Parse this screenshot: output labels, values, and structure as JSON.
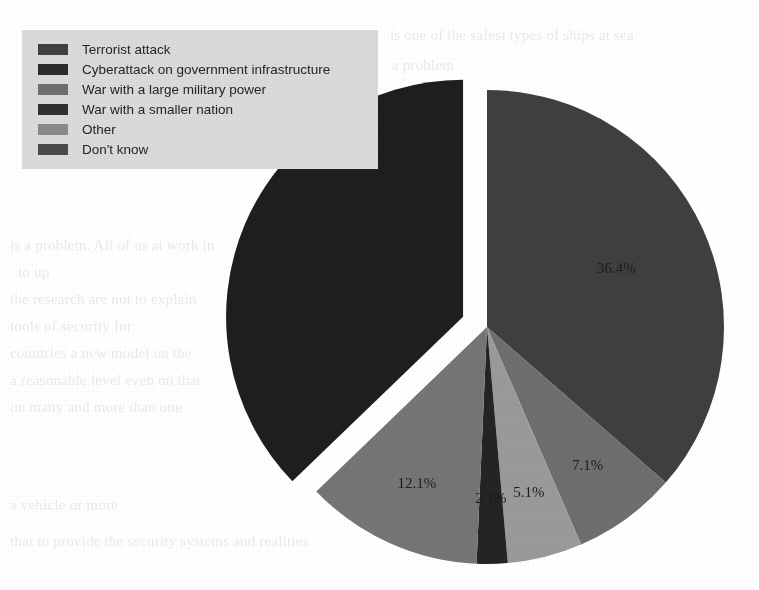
{
  "legend": {
    "items": [
      {
        "label": "Terrorist attack",
        "color": "#3f3f3f"
      },
      {
        "label": "Cyberattack on government infrastructure",
        "color": "#2b2b2b"
      },
      {
        "label": "War with a large military power",
        "color": "#6e6e6e"
      },
      {
        "label": "War with a smaller nation",
        "color": "#303030"
      },
      {
        "label": "Other",
        "color": "#8a8a8a"
      },
      {
        "label": "Don't know",
        "color": "#4a4a4a"
      }
    ]
  },
  "chart_data": {
    "type": "pie",
    "title": "",
    "labels": [
      "Terrorist attack",
      "Cyberattack on government infrastructure",
      "War with a large military power",
      "War with a smaller nation",
      "Other",
      "Don't know"
    ],
    "values": [
      36.4,
      7.1,
      5.1,
      2.1,
      12.1,
      37.2
    ],
    "value_labels": [
      "36.4%",
      "7.1%",
      "5.1%",
      "2.1%",
      "12.1%",
      ""
    ],
    "colors": [
      "#3f3f3f",
      "#6e6e6e",
      "#9a9a9a",
      "#242424",
      "#757575",
      "#1e1e1e"
    ],
    "exploded": [
      false,
      false,
      false,
      false,
      false,
      true
    ],
    "legend_position": "top-left",
    "grid": false,
    "xlabel": "",
    "ylabel": ""
  },
  "slice_labels": {
    "s0": "36.4%",
    "s1": "7.1%",
    "s2": "5.1%",
    "s3": "2.1%",
    "s4": "12.1%"
  },
  "ghost_text": {
    "lines": [
      "is one of the safest types of ships at sea",
      "a problem",
      "surveys",
      "resource",
      "is a problem.  All of us at work in",
      "to up",
      "the research are not to explain",
      "tools of  security for",
      "countries a new model on the",
      "a reasonable level even on that",
      "on many and more than one",
      "a vehicle or more",
      "that to provide the security systems and realities"
    ]
  }
}
